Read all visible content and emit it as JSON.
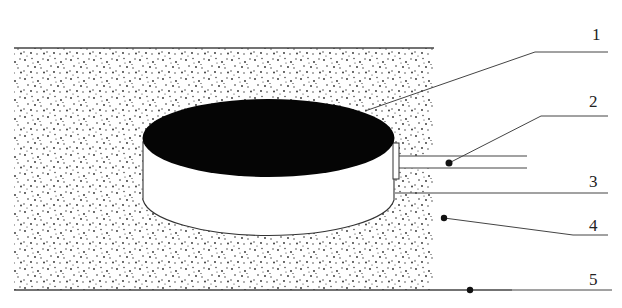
{
  "diagram": {
    "type": "cross-section schematic",
    "background_color": "#ffffff",
    "stroke_color": "#333333",
    "fill_dark": "#050505",
    "stipple_color": "#2a2a2a",
    "labels": [
      {
        "id": "1",
        "text": "1",
        "target": "top surface of disc (dark ellipse)"
      },
      {
        "id": "2",
        "text": "2",
        "target": "horizontal pipe/conduit"
      },
      {
        "id": "3",
        "text": "3",
        "target": "horizontal line at cylinder base level"
      },
      {
        "id": "4",
        "text": "4",
        "target": "stippled fill medium"
      },
      {
        "id": "5",
        "text": "5",
        "target": "bottom boundary line"
      }
    ]
  }
}
